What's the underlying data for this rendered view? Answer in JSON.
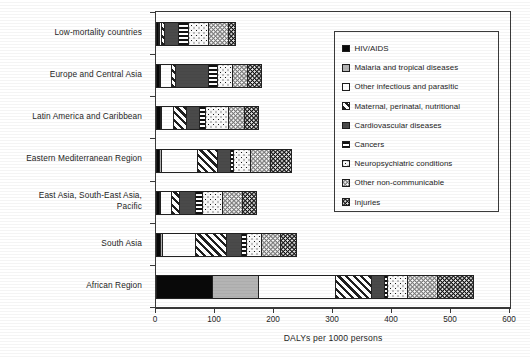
{
  "chart_data": {
    "type": "bar",
    "orientation": "horizontal",
    "stacked": true,
    "title": "",
    "xlabel": "DALYs per 1000 persons",
    "ylabel": "",
    "xlim": [
      0,
      600
    ],
    "xticks": [
      0,
      100,
      200,
      300,
      400,
      500,
      600
    ],
    "grid": false,
    "legend_position": "top-right-inside",
    "categories": [
      "Low-mortality countries",
      "Europe and Central Asia",
      "Latin America and Caribbean",
      "Eastern Mediterranean Region",
      "East Asia, South-East Asia, Pacific",
      "South Asia",
      "African Region"
    ],
    "series": [
      {
        "name": "HIV/AIDS",
        "pattern": "solid-black",
        "values": [
          2,
          3,
          5,
          3,
          3,
          5,
          93
        ]
      },
      {
        "name": "Malaria and tropical diseases",
        "pattern": "solid-light-gray",
        "values": [
          1,
          1,
          2,
          4,
          2,
          4,
          78
        ]
      },
      {
        "name": "Other infectious and parasitic",
        "pattern": "white",
        "values": [
          3,
          18,
          20,
          60,
          18,
          55,
          130
        ]
      },
      {
        "name": "Maternal, perinatal, nutritional",
        "pattern": "diagonal-hatch",
        "values": [
          4,
          8,
          22,
          34,
          14,
          53,
          62
        ]
      },
      {
        "name": "Cardiovascular diseases",
        "pattern": "solid-dark-gray",
        "values": [
          24,
          55,
          23,
          22,
          27,
          26,
          22
        ]
      },
      {
        "name": "Cancers",
        "pattern": "horizontal-lines",
        "values": [
          17,
          15,
          9,
          6,
          13,
          8,
          5
        ]
      },
      {
        "name": "Neuropsychiatric conditions",
        "pattern": "fine-dots-white",
        "values": [
          35,
          27,
          39,
          28,
          34,
          26,
          33
        ]
      },
      {
        "name": "Other non-communicable",
        "pattern": "white-dots-on-gray",
        "values": [
          33,
          25,
          28,
          35,
          33,
          32,
          52
        ]
      },
      {
        "name": "Injuries",
        "pattern": "white-dots-on-black",
        "values": [
          13,
          24,
          24,
          35,
          24,
          26,
          60
        ]
      }
    ],
    "totals": [
      132,
      176,
      172,
      227,
      168,
      235,
      535
    ]
  },
  "legend": {
    "items": [
      {
        "label": "HIV/AIDS"
      },
      {
        "label": "Malaria and tropical diseases"
      },
      {
        "label": "Other infectious and parasitic"
      },
      {
        "label": "Maternal, perinatal, nutritional"
      },
      {
        "label": "Cardiovascular diseases"
      },
      {
        "label": "Cancers"
      },
      {
        "label": "Neuropsychiatric conditions"
      },
      {
        "label": "Other non-communicable"
      },
      {
        "label": "Injuries"
      }
    ]
  },
  "axis": {
    "x_title": "DALYs per 1000 persons",
    "tick_labels": [
      "0",
      "100",
      "200",
      "300",
      "400",
      "500",
      "600"
    ]
  },
  "colors": {
    "axis": "#3a3a3a",
    "text": "#262626",
    "hiv": "#090909",
    "malaria": "#b4b4b4",
    "other_infectious": "#ffffff",
    "cardiovascular": "#4a4a4a",
    "other_noncommunicable": "#7d7d7d",
    "injuries": "#141414"
  }
}
